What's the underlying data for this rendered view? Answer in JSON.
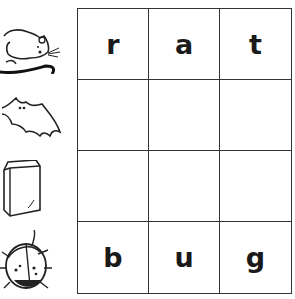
{
  "worksheet": {
    "pictures": [
      {
        "name": "rat",
        "icon": "rat-icon"
      },
      {
        "name": "bat",
        "icon": "bat-icon"
      },
      {
        "name": "bag",
        "icon": "bag-icon"
      },
      {
        "name": "bug",
        "icon": "bug-icon"
      }
    ],
    "grid": [
      [
        "r",
        "a",
        "t"
      ],
      [
        "",
        "",
        ""
      ],
      [
        "",
        "",
        ""
      ],
      [
        "b",
        "u",
        "g"
      ]
    ]
  }
}
